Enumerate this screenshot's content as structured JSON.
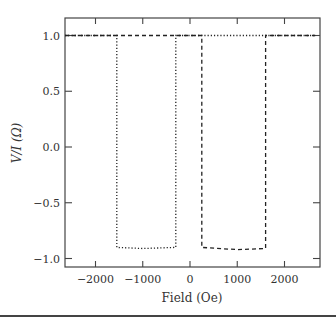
{
  "chart_data": {
    "type": "line",
    "title": "",
    "xlabel": "Field (Oe)",
    "ylabel": "V/I (Ω)",
    "xlim": [
      -2650,
      2650
    ],
    "ylim": [
      -1.07,
      1.11
    ],
    "xticks": [
      -2000,
      -1000,
      0,
      1000,
      2000
    ],
    "xtick_labels": [
      "−2000",
      "−1000",
      "0",
      "1000",
      "2000"
    ],
    "yticks": [
      1.0,
      0.5,
      0.0,
      -0.5,
      -1.0
    ],
    "ytick_labels": [
      "1.0",
      "0.5",
      "0.0",
      "−0.5",
      "−1.0"
    ],
    "grid": false,
    "legend": null,
    "series": [
      {
        "name": "dotted sweep",
        "style": "dotted",
        "x": [
          -2650,
          -1550,
          -1550,
          -1000,
          -300,
          -300,
          2650
        ],
        "y": [
          1.0,
          1.0,
          -0.9,
          -0.91,
          -0.9,
          1.0,
          1.0
        ]
      },
      {
        "name": "dashed sweep",
        "style": "dashed",
        "x": [
          -2650,
          250,
          250,
          1000,
          1600,
          1600,
          2650
        ],
        "y": [
          1.0,
          1.0,
          -0.9,
          -0.92,
          -0.91,
          1.0,
          1.0
        ]
      }
    ]
  }
}
